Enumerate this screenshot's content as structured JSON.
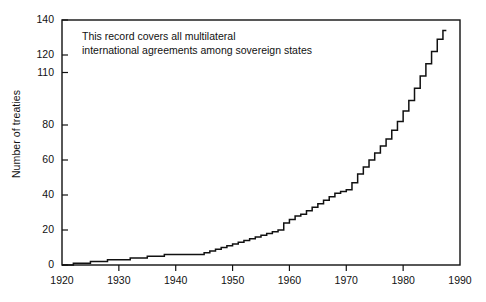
{
  "chart_data": {
    "type": "line",
    "title": "",
    "subtitle": "",
    "xlabel": "",
    "ylabel": "Number of treaties",
    "xlim": [
      1920,
      1990
    ],
    "ylim": [
      0,
      140
    ],
    "xticks": [
      1920,
      1930,
      1940,
      1950,
      1960,
      1970,
      1980,
      1990
    ],
    "xtick_labels": [
      "1920",
      "1930",
      "1940",
      "1950",
      "1960",
      "1970",
      "1980",
      "1990"
    ],
    "yticks": [
      0,
      20,
      40,
      60,
      80,
      110,
      120,
      140
    ],
    "ytick_labels": [
      "0",
      "20",
      "40",
      "60",
      "80",
      "110",
      "120",
      "140"
    ],
    "grid": false,
    "legend": null,
    "drawstyle": "steps-post",
    "line_color": "#111111",
    "annotations": [
      {
        "name": "record-scope-note",
        "lines": [
          "This record covers all multilateral",
          "international agreements among sovereign states"
        ],
        "x": 1924,
        "y": 124
      }
    ],
    "series": [
      {
        "name": "Cumulative multilateral treaties",
        "x": [
          1920,
          1921,
          1922,
          1923,
          1924,
          1925,
          1926,
          1927,
          1928,
          1929,
          1930,
          1931,
          1932,
          1933,
          1934,
          1935,
          1936,
          1937,
          1938,
          1939,
          1940,
          1941,
          1942,
          1943,
          1944,
          1945,
          1946,
          1947,
          1948,
          1949,
          1950,
          1951,
          1952,
          1953,
          1954,
          1955,
          1956,
          1957,
          1958,
          1959,
          1960,
          1961,
          1962,
          1963,
          1964,
          1965,
          1966,
          1967,
          1968,
          1969,
          1970,
          1971,
          1972,
          1973,
          1974,
          1975,
          1976,
          1977,
          1978,
          1979,
          1980,
          1981,
          1982,
          1983,
          1984,
          1985,
          1986,
          1987
        ],
        "values": [
          0,
          0,
          1,
          1,
          1,
          2,
          2,
          2,
          3,
          3,
          3,
          3,
          4,
          4,
          4,
          5,
          5,
          5,
          6,
          6,
          6,
          6,
          6,
          6,
          6,
          7,
          8,
          9,
          10,
          11,
          12,
          13,
          14,
          15,
          16,
          17,
          18,
          19,
          20,
          24,
          26,
          28,
          29,
          31,
          33,
          35,
          37,
          39,
          41,
          42,
          43,
          47,
          52,
          56,
          60,
          64,
          68,
          72,
          77,
          82,
          88,
          94,
          101,
          108,
          115,
          122,
          129,
          134
        ]
      }
    ]
  }
}
